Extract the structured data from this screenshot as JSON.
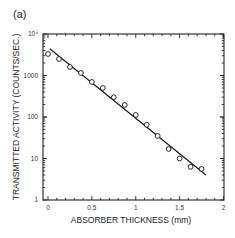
{
  "panel_label": "(a)",
  "chart_data": {
    "type": "scatter",
    "title": "",
    "xlabel": "ABSORBER THICKNESS (mm)",
    "ylabel": "TRANSMITTED ACTIVITY (COUNTS/SEC.)",
    "xlim": [
      0,
      2
    ],
    "ylim": [
      1,
      10000
    ],
    "yscale": "log",
    "grid": false,
    "legend": null,
    "x_ticks": [
      "0",
      "0.5",
      "1",
      "1.5",
      "2"
    ],
    "y_ticks": [
      "1",
      "10",
      "100",
      "1000",
      "10⁴"
    ],
    "series": [
      {
        "name": "measured",
        "marker": "open-circle",
        "x": [
          0,
          0.125,
          0.25,
          0.375,
          0.5,
          0.625,
          0.75,
          0.875,
          1.0,
          1.125,
          1.25,
          1.375,
          1.5,
          1.625,
          1.75
        ],
        "y": [
          3300,
          2500,
          1600,
          1150,
          700,
          500,
          300,
          195,
          112,
          65,
          35,
          17,
          10,
          6.3,
          5.6
        ]
      },
      {
        "name": "fit",
        "style": "line",
        "x": [
          0.02,
          1.8
        ],
        "y": [
          4400,
          4.0
        ]
      }
    ]
  }
}
